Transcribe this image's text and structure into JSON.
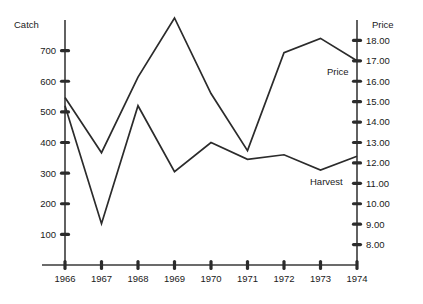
{
  "chart_data": {
    "type": "line",
    "title": "",
    "xlabel": "",
    "ylabel": "Catch",
    "y2label": "Price",
    "grid": false,
    "legend_position": "inline-annotation",
    "categories": [
      "1966",
      "1967",
      "1968",
      "1969",
      "1970",
      "1971",
      "1972",
      "1973",
      "1974"
    ],
    "x": [
      1966,
      1967,
      1968,
      1969,
      1970,
      1971,
      1972,
      1973,
      1974
    ],
    "ylim": [
      0,
      800
    ],
    "y2lim": [
      7.0,
      19.0
    ],
    "yticks": [
      100,
      200,
      300,
      400,
      500,
      600,
      700
    ],
    "ytick_labels": [
      "100",
      "200",
      "300",
      "400",
      "500",
      "600",
      "700"
    ],
    "y2ticks": [
      8.0,
      9.0,
      10.0,
      11.0,
      12.0,
      13.0,
      14.0,
      15.0,
      16.0,
      17.0,
      18.0
    ],
    "y2tick_labels": [
      "8.00",
      "9.00",
      "10.00",
      "11.00",
      "12.00",
      "13.00",
      "14.00",
      "15.00",
      "16.00",
      "17.00",
      "18.00"
    ],
    "series": [
      {
        "name": "Price",
        "axis": "right",
        "annotation": "Price",
        "values": [
          15.2,
          12.5,
          16.2,
          19.1,
          15.4,
          12.6,
          17.4,
          18.1,
          17.0
        ]
      },
      {
        "name": "Harvest",
        "axis": "left",
        "annotation": "Harvest",
        "values": [
          520,
          135,
          520,
          305,
          400,
          345,
          360,
          310,
          355
        ]
      }
    ]
  },
  "axes": {
    "left_title": "Catch",
    "right_title": "Price"
  },
  "annotations": {
    "price": "Price",
    "harvest": "Harvest"
  },
  "colors": {
    "line": "#2b2b2b",
    "axis": "#3a3a3a",
    "background": "#ffffff",
    "text": "#1a1a1a"
  }
}
